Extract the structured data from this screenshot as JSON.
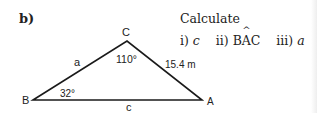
{
  "part_label": "b)",
  "instruction": {
    "title": "Calculate",
    "items": [
      {
        "num": "i)",
        "target": "c"
      },
      {
        "num": "ii)",
        "target_prefix": "B",
        "target_hat": "A",
        "target_suffix": "C"
      },
      {
        "num": "iii)",
        "target": "a"
      }
    ]
  },
  "triangle": {
    "vertices": {
      "A": "A",
      "B": "B",
      "C": "C"
    },
    "sides": {
      "a": "a",
      "c": "c",
      "b": "15.4 m"
    },
    "angles": {
      "B": "32°",
      "C": "110°"
    },
    "line_color": "#1a1a1a"
  }
}
